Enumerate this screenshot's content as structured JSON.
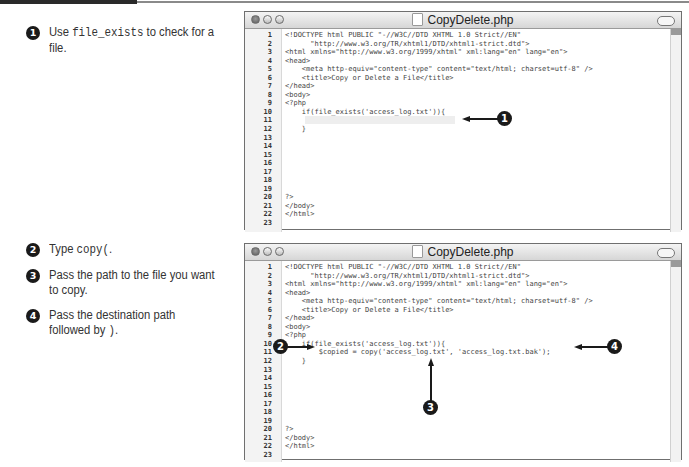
{
  "top_section": {
    "steps": [
      {
        "num": "1",
        "pre": "Use ",
        "code": "file_exists",
        "post": " to check for a file."
      }
    ]
  },
  "bottom_section": {
    "steps": [
      {
        "num": "2",
        "pre": "Type ",
        "code": "copy(",
        "post": "."
      },
      {
        "num": "3",
        "pre": "Pass the path to the file you want to copy.",
        "code": "",
        "post": ""
      },
      {
        "num": "4",
        "pre": "Pass the destination path followed by ",
        "code": ")",
        "post": "."
      }
    ]
  },
  "windows": [
    {
      "title": "CopyDelete.php",
      "lines": [
        {
          "n": "1",
          "text": "<!DOCTYPE html PUBLIC \"-//W3C//DTD XHTML 1.0 Strict//EN\""
        },
        {
          "n": "2",
          "text": "      \"http://www.w3.org/TR/xhtml1/DTD/xhtml1-strict.dtd\">"
        },
        {
          "n": "3",
          "text": "<html xmlns=\"http://www.w3.org/1999/xhtml\" xml:lang=\"en\" lang=\"en\">"
        },
        {
          "n": "4",
          "text": "<head>"
        },
        {
          "n": "5",
          "text": "    <meta http-equiv=\"content-type\" content=\"text/html; charset=utf-8\" />"
        },
        {
          "n": "6",
          "text": "    <title>Copy or Delete a File</title>"
        },
        {
          "n": "7",
          "text": "</head>"
        },
        {
          "n": "8",
          "text": "<body>"
        },
        {
          "n": "9",
          "text": "<?php"
        },
        {
          "n": "10",
          "text": "    if(file_exists('access_log.txt')){"
        },
        {
          "n": "11",
          "text": ""
        },
        {
          "n": "12",
          "text": "    }"
        },
        {
          "n": "13",
          "text": ""
        },
        {
          "n": "14",
          "text": ""
        },
        {
          "n": "15",
          "text": ""
        },
        {
          "n": "16",
          "text": ""
        },
        {
          "n": "17",
          "text": ""
        },
        {
          "n": "18",
          "text": ""
        },
        {
          "n": "19",
          "text": ""
        },
        {
          "n": "20",
          "text": "?>"
        },
        {
          "n": "21",
          "text": "</body>"
        },
        {
          "n": "22",
          "text": "</html>"
        },
        {
          "n": "23",
          "text": ""
        }
      ],
      "callouts": [
        "1"
      ]
    },
    {
      "title": "CopyDelete.php",
      "lines": [
        {
          "n": "1",
          "text": "<!DOCTYPE html PUBLIC \"-//W3C//DTD XHTML 1.0 Strict//EN\""
        },
        {
          "n": "2",
          "text": "      \"http://www.w3.org/TR/xhtml1/DTD/xhtml1-strict.dtd\">"
        },
        {
          "n": "3",
          "text": "<html xmlns=\"http://www.w3.org/1999/xhtml\" xml:lang=\"en\" lang=\"en\">"
        },
        {
          "n": "4",
          "text": "<head>"
        },
        {
          "n": "5",
          "text": "    <meta http-equiv=\"content-type\" content=\"text/html; charset=utf-8\" />"
        },
        {
          "n": "6",
          "text": "    <title>Copy or Delete a File</title>"
        },
        {
          "n": "7",
          "text": "</head>"
        },
        {
          "n": "8",
          "text": "<body>"
        },
        {
          "n": "9",
          "text": "<?php"
        },
        {
          "n": "10",
          "text": "    if(file_exists('access_log.txt')){"
        },
        {
          "n": "11",
          "text": "        $copied = copy('access_log.txt', 'access_log.txt.bak');"
        },
        {
          "n": "12",
          "text": "    }"
        },
        {
          "n": "13",
          "text": ""
        },
        {
          "n": "14",
          "text": ""
        },
        {
          "n": "15",
          "text": ""
        },
        {
          "n": "16",
          "text": ""
        },
        {
          "n": "17",
          "text": ""
        },
        {
          "n": "18",
          "text": ""
        },
        {
          "n": "19",
          "text": ""
        },
        {
          "n": "20",
          "text": "?>"
        },
        {
          "n": "21",
          "text": "</body>"
        },
        {
          "n": "22",
          "text": "</html>"
        },
        {
          "n": "23",
          "text": ""
        }
      ],
      "callouts": [
        "2",
        "3",
        "4"
      ]
    }
  ]
}
